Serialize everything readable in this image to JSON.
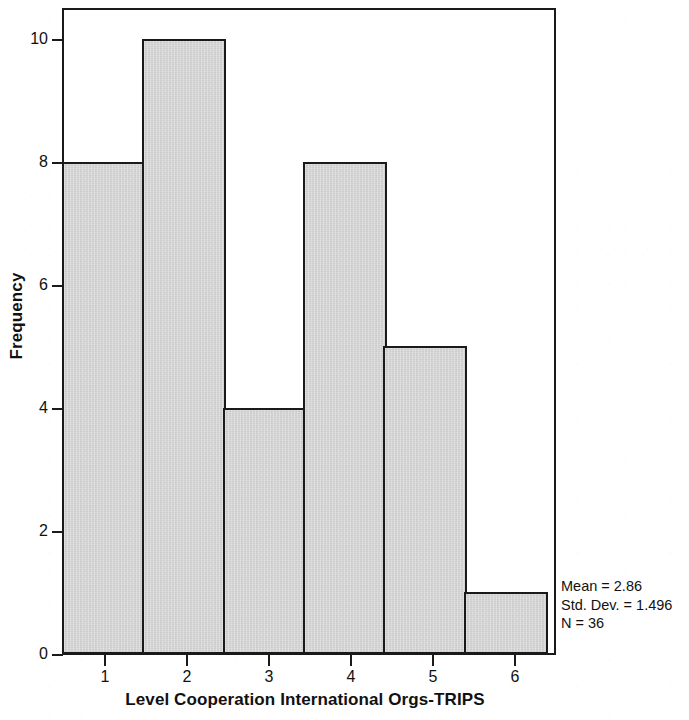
{
  "chart_data": {
    "type": "bar",
    "title": "",
    "subtitle": "",
    "xlabel": "Level Cooperation International Orgs-TRIPS",
    "ylabel": "Frequency",
    "categories": [
      "1",
      "2",
      "3",
      "4",
      "5",
      "6"
    ],
    "values": [
      8,
      10,
      4,
      8,
      5,
      1
    ],
    "series": [
      {
        "name": "Frequency",
        "values": [
          8,
          10,
          4,
          8,
          5,
          1
        ]
      }
    ],
    "xlim": [
      0.5,
      6.5
    ],
    "ylim": [
      0,
      10.5
    ],
    "x_ticks": [
      "1",
      "2",
      "3",
      "4",
      "5",
      "6"
    ],
    "y_ticks": [
      "0",
      "2",
      "4",
      "6",
      "8",
      "10"
    ],
    "grid": false,
    "legend": false,
    "legend_position": "none",
    "bar_fill_color": "#d6d6d6",
    "bar_edge_color": "#1a1a1a",
    "annotations": [
      "Mean = 2.86",
      "Std. Dev. = 1.496",
      "N = 36"
    ],
    "statistics": {
      "mean": "Mean = 2.86",
      "std_dev": "Std. Dev. = 1.496",
      "n": "N = 36"
    }
  }
}
